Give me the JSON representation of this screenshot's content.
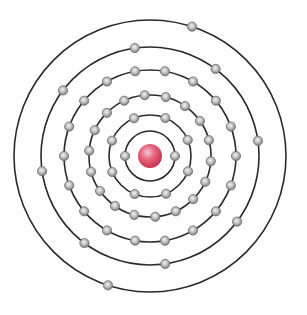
{
  "diagram": {
    "type": "bohr-atom-model",
    "center": [
      150,
      156
    ],
    "nucleus": {
      "radius": 12,
      "color": "#e0506a",
      "highlight": "#f7b3c0"
    },
    "electron": {
      "radius": 4.6,
      "fill": "#b8b8b8",
      "stroke": "#6e6e6e",
      "highlight": "#f2f2f2"
    },
    "shell_stroke": "#2a2a2a",
    "shells": [
      {
        "index": 1,
        "radius": 25,
        "electrons": 2,
        "start_angle": 0
      },
      {
        "index": 2,
        "radius": 41,
        "electrons": 8,
        "start_angle": 22
      },
      {
        "index": 3,
        "radius": 61,
        "electrons": 18,
        "start_angle": 5
      },
      {
        "index": 4,
        "radius": 86,
        "electrons": 18,
        "start_angle": 0
      },
      {
        "index": 5,
        "radius": 109,
        "electrons": 8,
        "start_angle": -8
      },
      {
        "index": 6,
        "radius": 136,
        "electrons": 2,
        "start_angle": -72
      }
    ],
    "electron_configuration": [
      2,
      8,
      18,
      18,
      8,
      2
    ],
    "total_electrons": 56
  }
}
